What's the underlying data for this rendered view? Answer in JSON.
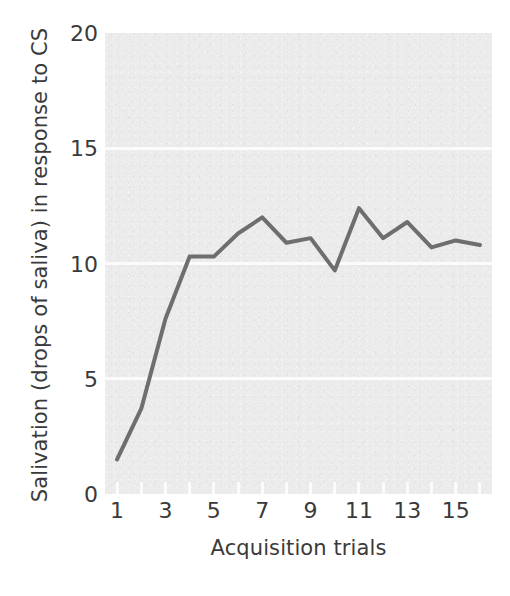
{
  "chart_data": {
    "type": "line",
    "title": "",
    "xlabel": "Acquisition trials",
    "ylabel": "Salivation (drops of saliva) in response to CS",
    "x": [
      1,
      2,
      3,
      4,
      5,
      6,
      7,
      8,
      9,
      10,
      11,
      12,
      13,
      14,
      15,
      16
    ],
    "values": [
      1.5,
      3.7,
      7.6,
      10.3,
      10.3,
      11.3,
      12.0,
      10.9,
      11.1,
      9.7,
      12.4,
      11.1,
      11.8,
      10.7,
      11.0,
      10.8
    ],
    "series": [
      {
        "name": "Salivation",
        "values": [
          1.5,
          3.7,
          7.6,
          10.3,
          10.3,
          11.3,
          12.0,
          10.9,
          11.1,
          9.7,
          12.4,
          11.1,
          11.8,
          10.7,
          11.0,
          10.8
        ]
      }
    ],
    "xlim": [
      0.5,
      16.5
    ],
    "ylim": [
      0,
      20
    ],
    "yticks": [
      0,
      5,
      10,
      15,
      20
    ],
    "ytick_labels": [
      "0",
      "5",
      "10",
      "15",
      "20"
    ],
    "xticks": [
      1,
      3,
      5,
      7,
      9,
      11,
      13,
      15
    ],
    "xtick_labels": [
      "1",
      "3",
      "5",
      "7",
      "9",
      "11",
      "13",
      "15"
    ],
    "xtick_minor": [
      1,
      2,
      3,
      4,
      5,
      6,
      7,
      8,
      9,
      10,
      11,
      12,
      13,
      14,
      15,
      16
    ],
    "grid": true,
    "grid_axis": "y",
    "legend": "none",
    "colors": {
      "line": "#6e6e6e",
      "plot_background": "#ebebeb",
      "grid": "#fbfbfb",
      "text": "#3a3a3a",
      "page_background": "#ffffff"
    },
    "line_width": 4
  }
}
